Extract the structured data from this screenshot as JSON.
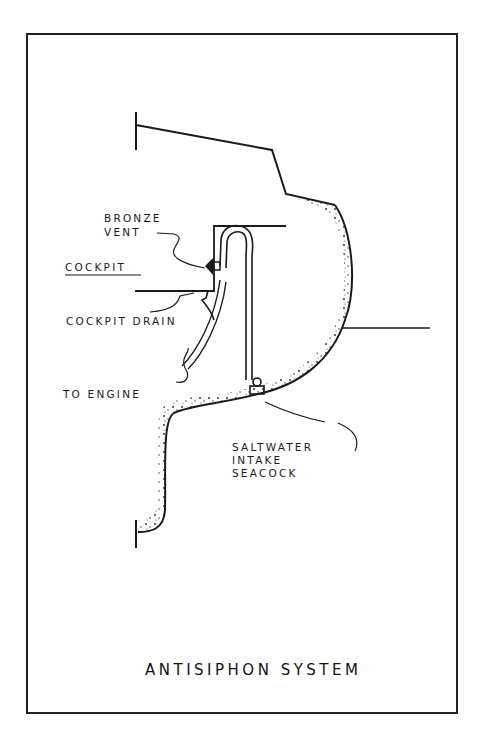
{
  "figure": {
    "title": "ANTISIPHON SYSTEM",
    "labels": {
      "bronze_vent_line1": "BRONZE",
      "bronze_vent_line2": "VENT",
      "cockpit": "COCKPIT",
      "cockpit_drain": "COCKPIT DRAIN",
      "to_engine": "TO ENGINE",
      "seacock_line1": "SALTWATER",
      "seacock_line2": "INTAKE",
      "seacock_line3": "SEACOCK"
    },
    "colors": {
      "ink": "#1a1a1a",
      "paper": "#ffffff"
    }
  }
}
